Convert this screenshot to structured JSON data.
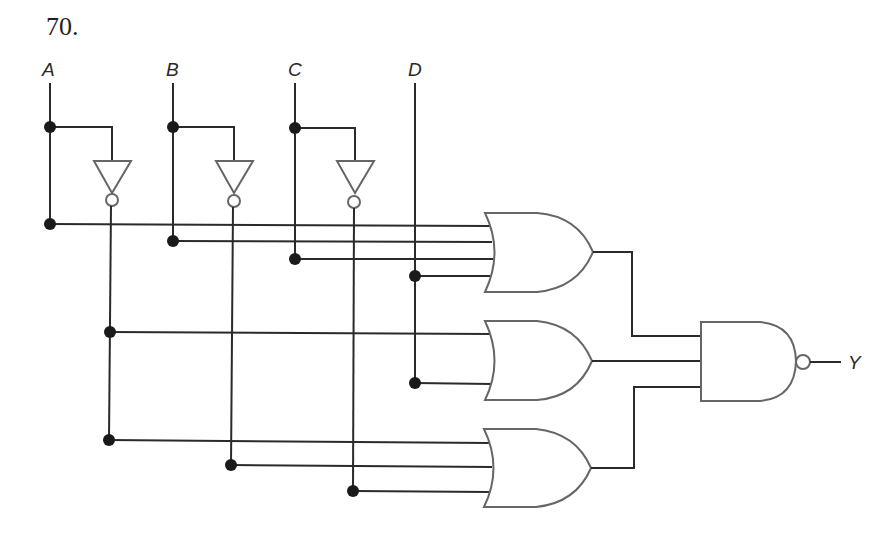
{
  "problem_number": "70.",
  "inputs": [
    {
      "label": "A",
      "x": 50
    },
    {
      "label": "B",
      "x": 173
    },
    {
      "label": "C",
      "x": 295
    },
    {
      "label": "D",
      "x": 415
    }
  ],
  "output": {
    "label": "Y"
  },
  "gates": [
    {
      "type": "NOT",
      "input": "A",
      "name": "inverter-a"
    },
    {
      "type": "NOT",
      "input": "B",
      "name": "inverter-b"
    },
    {
      "type": "NOT",
      "input": "C",
      "name": "inverter-c"
    },
    {
      "type": "OR",
      "name": "or-gate-1",
      "inputs": [
        "A",
        "B",
        "C",
        "D"
      ]
    },
    {
      "type": "OR",
      "name": "or-gate-2",
      "inputs": [
        "A'",
        "D"
      ]
    },
    {
      "type": "OR",
      "name": "or-gate-3",
      "inputs": [
        "A'",
        "B'",
        "C'"
      ]
    },
    {
      "type": "NAND",
      "name": "nand-gate",
      "inputs": [
        "or-gate-1",
        "or-gate-2",
        "or-gate-3"
      ],
      "output": "Y"
    }
  ],
  "colors": {
    "wire": "#2a2a2a",
    "gate_outline": "#666666",
    "junction": "#1a1a1a",
    "background": "#ffffff"
  }
}
